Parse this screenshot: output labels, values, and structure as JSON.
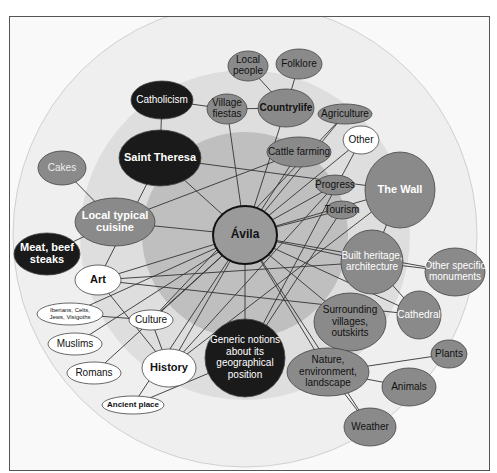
{
  "colors": {
    "ring_outer": "#ececec",
    "ring_mid": "#d9d9d9",
    "ring_inner": "#bdbdbd",
    "dark": "#1a1a1a",
    "mid": "#8a8a8a",
    "light": "#ffffff",
    "edge": "#333333"
  },
  "center": {
    "label": "Ávila",
    "cx": 245,
    "cy": 235,
    "rx": 32,
    "ry": 29
  },
  "nodes": [
    {
      "id": "local-people",
      "lines": [
        "Local",
        "people"
      ],
      "cx": 248,
      "cy": 66,
      "rx": 20,
      "ry": 15,
      "fill": "mid",
      "fs": 10
    },
    {
      "id": "folklore",
      "lines": [
        "Folklore"
      ],
      "cx": 299,
      "cy": 64,
      "rx": 23,
      "ry": 15,
      "fill": "mid",
      "fs": 10
    },
    {
      "id": "catholicism",
      "lines": [
        "Catholicism"
      ],
      "cx": 162,
      "cy": 100,
      "rx": 31,
      "ry": 19,
      "fill": "dark",
      "fs": 10,
      "color": "#fff"
    },
    {
      "id": "village-fiestas",
      "lines": [
        "Village",
        "fiestas"
      ],
      "cx": 227,
      "cy": 109,
      "rx": 20,
      "ry": 15,
      "fill": "mid",
      "fs": 10
    },
    {
      "id": "countrylife",
      "lines": [
        "Countrylife"
      ],
      "cx": 286,
      "cy": 108,
      "rx": 28,
      "ry": 19,
      "fill": "mid",
      "fs": 10,
      "bold": true
    },
    {
      "id": "agriculture",
      "lines": [
        "Agriculture"
      ],
      "cx": 345,
      "cy": 114,
      "rx": 27,
      "ry": 10,
      "fill": "mid",
      "fs": 10
    },
    {
      "id": "other",
      "lines": [
        "Other"
      ],
      "cx": 361,
      "cy": 140,
      "rx": 18,
      "ry": 14,
      "fill": "light",
      "fs": 10
    },
    {
      "id": "saint-theresa",
      "lines": [
        "Saint Theresa"
      ],
      "cx": 160,
      "cy": 158,
      "rx": 41,
      "ry": 28,
      "fill": "dark",
      "fs": 11,
      "bold": true,
      "color": "#fff"
    },
    {
      "id": "cattle-farming",
      "lines": [
        "Cattle farming"
      ],
      "cx": 299,
      "cy": 152,
      "rx": 32,
      "ry": 15,
      "fill": "mid",
      "fs": 10
    },
    {
      "id": "cakes",
      "lines": [
        "Cakes"
      ],
      "cx": 62,
      "cy": 168,
      "rx": 24,
      "ry": 17,
      "fill": "mid",
      "fs": 10,
      "color": "#eee"
    },
    {
      "id": "progress",
      "lines": [
        "Progress"
      ],
      "cx": 335,
      "cy": 185,
      "rx": 19,
      "ry": 10,
      "fill": "mid",
      "fs": 10
    },
    {
      "id": "the-wall",
      "lines": [
        "The Wall"
      ],
      "cx": 400,
      "cy": 190,
      "rx": 35,
      "ry": 38,
      "fill": "mid",
      "fs": 11,
      "bold": true,
      "color": "#fff"
    },
    {
      "id": "tourism",
      "lines": [
        "Tourism"
      ],
      "cx": 342,
      "cy": 210,
      "rx": 16,
      "ry": 9,
      "fill": "mid",
      "fs": 10
    },
    {
      "id": "local-cuisine",
      "lines": [
        "Local typical",
        "cuisine"
      ],
      "cx": 115,
      "cy": 222,
      "rx": 40,
      "ry": 24,
      "fill": "mid",
      "fs": 11,
      "bold": true,
      "color": "#fff"
    },
    {
      "id": "meat-beef-steaks",
      "lines": [
        "Meat, beef",
        "steaks"
      ],
      "cx": 47,
      "cy": 254,
      "rx": 33,
      "ry": 21,
      "fill": "dark",
      "fs": 11,
      "bold": true,
      "color": "#fff"
    },
    {
      "id": "built-heritage",
      "lines": [
        "Built heritage,",
        "architecture"
      ],
      "cx": 372,
      "cy": 262,
      "rx": 31,
      "ry": 32,
      "fill": "mid",
      "fs": 10,
      "color": "#fff"
    },
    {
      "id": "art",
      "lines": [
        "Art"
      ],
      "cx": 98,
      "cy": 280,
      "rx": 23,
      "ry": 15,
      "fill": "light",
      "fs": 11,
      "bold": true
    },
    {
      "id": "other-monuments",
      "lines": [
        "Other specific",
        "monuments"
      ],
      "cx": 455,
      "cy": 272,
      "rx": 30,
      "ry": 24,
      "fill": "mid",
      "fs": 10,
      "color": "#fff"
    },
    {
      "id": "iberians",
      "lines": [
        "Iberians, Celts,",
        "Jews, Visigoths"
      ],
      "cx": 70,
      "cy": 314,
      "rx": 33,
      "ry": 11,
      "fill": "light",
      "fs": 6
    },
    {
      "id": "culture",
      "lines": [
        "Culture"
      ],
      "cx": 151,
      "cy": 320,
      "rx": 22,
      "ry": 10,
      "fill": "light",
      "fs": 10
    },
    {
      "id": "surrounding-villages",
      "lines": [
        "Surrounding",
        "villages,",
        "outskirts"
      ],
      "cx": 350,
      "cy": 322,
      "rx": 36,
      "ry": 29,
      "fill": "mid",
      "fs": 10
    },
    {
      "id": "cathedral",
      "lines": [
        "Cathedral"
      ],
      "cx": 419,
      "cy": 315,
      "rx": 22,
      "ry": 24,
      "fill": "mid",
      "fs": 10,
      "color": "#fff"
    },
    {
      "id": "muslims",
      "lines": [
        "Muslims"
      ],
      "cx": 75,
      "cy": 344,
      "rx": 27,
      "ry": 11,
      "fill": "light",
      "fs": 10
    },
    {
      "id": "generic-notions",
      "lines": [
        "Generic notions",
        "about its",
        "geographical",
        "position"
      ],
      "cx": 245,
      "cy": 358,
      "rx": 40,
      "ry": 39,
      "fill": "dark",
      "fs": 10,
      "color": "#fff"
    },
    {
      "id": "plants",
      "lines": [
        "Plants"
      ],
      "cx": 449,
      "cy": 354,
      "rx": 18,
      "ry": 14,
      "fill": "mid",
      "fs": 10
    },
    {
      "id": "romans",
      "lines": [
        "Romans"
      ],
      "cx": 94,
      "cy": 373,
      "rx": 27,
      "ry": 11,
      "fill": "light",
      "fs": 10
    },
    {
      "id": "history",
      "lines": [
        "History"
      ],
      "cx": 169,
      "cy": 368,
      "rx": 27,
      "ry": 19,
      "fill": "light",
      "fs": 11,
      "bold": true
    },
    {
      "id": "nature",
      "lines": [
        "Nature,",
        "environment,",
        "landscape"
      ],
      "cx": 328,
      "cy": 372,
      "rx": 41,
      "ry": 24,
      "fill": "mid",
      "fs": 10
    },
    {
      "id": "animals",
      "lines": [
        "Animals"
      ],
      "cx": 409,
      "cy": 387,
      "rx": 27,
      "ry": 19,
      "fill": "mid",
      "fs": 10
    },
    {
      "id": "ancient-place",
      "lines": [
        "Ancient place"
      ],
      "cx": 133,
      "cy": 405,
      "rx": 31,
      "ry": 9,
      "fill": "light",
      "fs": 8,
      "bold": true
    },
    {
      "id": "weather",
      "lines": [
        "Weather"
      ],
      "cx": 370,
      "cy": 427,
      "rx": 26,
      "ry": 19,
      "fill": "mid",
      "fs": 10
    }
  ],
  "edges": [
    [
      "local-people",
      "countrylife"
    ],
    [
      "folklore",
      "countrylife"
    ],
    [
      "village-fiestas",
      "countrylife"
    ],
    [
      "catholicism",
      "village-fiestas"
    ],
    [
      "catholicism",
      "saint-theresa"
    ],
    [
      "cakes",
      "local-cuisine"
    ],
    [
      "local-cuisine",
      "meat-beef-steaks"
    ],
    [
      "built-heritage",
      "other-monuments"
    ],
    [
      "built-heritage",
      "cathedral"
    ],
    [
      "the-wall",
      "built-heritage"
    ],
    [
      "nature",
      "plants"
    ],
    [
      "nature",
      "animals"
    ],
    [
      "nature",
      "weather"
    ],
    [
      "art",
      "history"
    ],
    [
      "culture",
      "history"
    ],
    [
      "iberians",
      "culture"
    ],
    [
      "muslims",
      "center"
    ],
    [
      "romans",
      "center"
    ],
    [
      "ancient-place",
      "center"
    ],
    [
      "ancient-place",
      "generic-notions"
    ],
    [
      "center",
      "saint-theresa"
    ],
    [
      "center",
      "local-cuisine"
    ],
    [
      "center",
      "art"
    ],
    [
      "center",
      "culture"
    ],
    [
      "center",
      "history"
    ],
    [
      "center",
      "generic-notions"
    ],
    [
      "center",
      "village-fiestas"
    ],
    [
      "center",
      "countrylife"
    ],
    [
      "center",
      "agriculture"
    ],
    [
      "center",
      "cattle-farming"
    ],
    [
      "center",
      "other"
    ],
    [
      "center",
      "progress"
    ],
    [
      "center",
      "tourism"
    ],
    [
      "center",
      "the-wall"
    ],
    [
      "center",
      "built-heritage"
    ],
    [
      "center",
      "other-monuments"
    ],
    [
      "center",
      "cathedral"
    ],
    [
      "center",
      "surrounding-villages"
    ],
    [
      "center",
      "nature"
    ],
    [
      "center",
      "weather"
    ],
    [
      "center",
      "iberians"
    ],
    [
      "saint-theresa",
      "the-wall"
    ],
    [
      "local-cuisine",
      "cattle-farming"
    ],
    [
      "art",
      "built-heritage"
    ],
    [
      "art",
      "cathedral"
    ],
    [
      "history",
      "the-wall"
    ],
    [
      "history",
      "progress"
    ],
    [
      "generic-notions",
      "tourism"
    ],
    [
      "generic-notions",
      "other"
    ],
    [
      "culture",
      "agriculture"
    ],
    [
      "saint-theresa",
      "art"
    ]
  ]
}
